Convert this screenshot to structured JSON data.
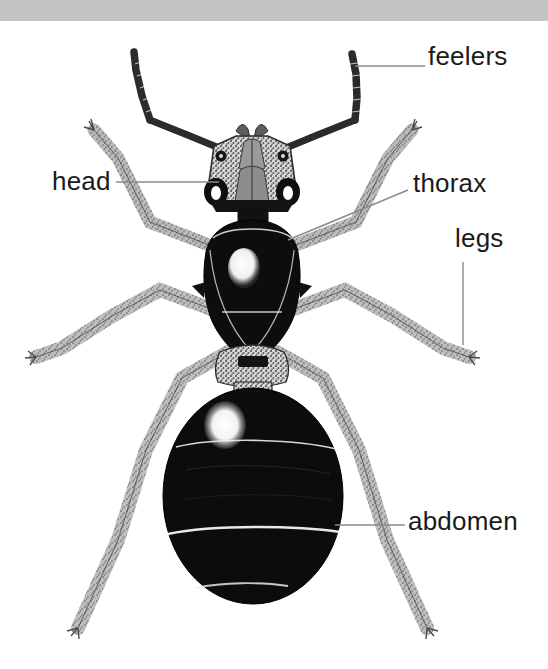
{
  "page": {
    "width": 548,
    "height": 669,
    "background_color": "#ffffff",
    "top_bar_color": "#c3c3c3"
  },
  "illustration": {
    "subject": "ant",
    "style": "black-and-white stippled pen-and-ink drawing",
    "view": "dorsal",
    "body_color": "#0d0d0d",
    "stipple_color": "#8e8e8e",
    "highlight_color": "#ffffff"
  },
  "labels": [
    {
      "id": "feelers",
      "text": "feelers",
      "leader": "horizontal-line-to-left"
    },
    {
      "id": "head",
      "text": "head",
      "leader": "horizontal-line-to-right"
    },
    {
      "id": "thorax",
      "text": "thorax",
      "leader": "diagonal-line-down-left"
    },
    {
      "id": "legs",
      "text": "legs",
      "leader": "vertical-line-down"
    },
    {
      "id": "abdomen",
      "text": "abdomen",
      "leader": "horizontal-line-to-left"
    }
  ],
  "leader_line_color": "#8a8a8a"
}
